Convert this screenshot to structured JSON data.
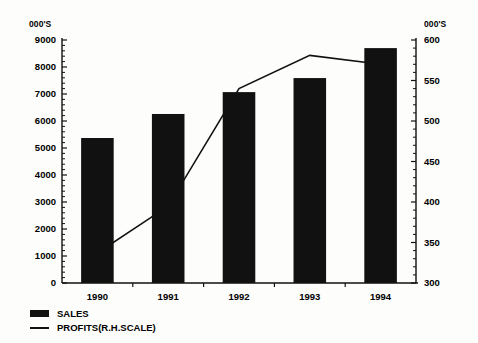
{
  "chart_data": {
    "type": "bar",
    "title": "",
    "subtitle": "",
    "xlabel": "",
    "ylabel": "000'S",
    "y2label": "000'S",
    "categories": [
      "1990",
      "1991",
      "1992",
      "1993",
      "1994"
    ],
    "series": [
      {
        "name": "SALES",
        "type": "bar",
        "axis": "left",
        "values": [
          5370,
          6260,
          7070,
          7590,
          8700
        ]
      },
      {
        "name": "PROFITS(R.H.SCALE)",
        "type": "line",
        "axis": "right",
        "values": [
          337,
          395,
          540,
          581,
          570
        ]
      }
    ],
    "ylim": [
      0,
      9000
    ],
    "y2lim": [
      300,
      600
    ],
    "yticks": [
      0,
      1000,
      2000,
      3000,
      4000,
      5000,
      6000,
      7000,
      8000,
      9000
    ],
    "y2ticks": [
      300,
      350,
      400,
      450,
      500,
      550,
      600
    ],
    "yticklabels": [
      "0",
      "1000",
      "2000",
      "3000",
      "4000",
      "5000",
      "6000",
      "7000",
      "8000",
      "9000"
    ],
    "y2ticklabels": [
      "300",
      "350",
      "400",
      "450",
      "500",
      "550",
      "600"
    ],
    "grid": false,
    "minor_ticks": true,
    "legend_position": "bottom-left",
    "colors": {
      "bar": "#111111",
      "line": "#111111",
      "axis": "#111111",
      "background": "#fdfdfb"
    }
  },
  "axes": {
    "left_unit": "000'S",
    "right_unit": "000'S"
  },
  "legend": {
    "items": [
      {
        "label": "SALES",
        "marker": "filled-rect-swatch"
      },
      {
        "label": "PROFITS(R.H.SCALE)",
        "marker": "line-swatch"
      }
    ]
  }
}
